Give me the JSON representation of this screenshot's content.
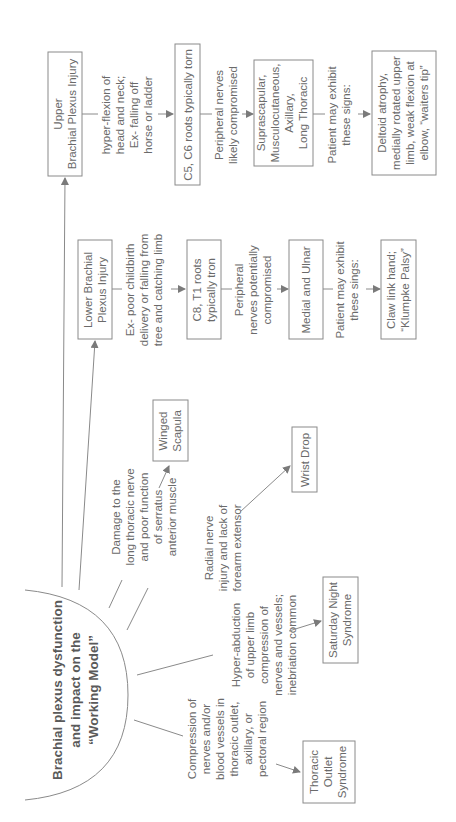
{
  "central": {
    "lines": [
      "Brachial plexus dysfunction",
      "and impact on the",
      "“Working Model”"
    ]
  },
  "upper": {
    "title": [
      "Upper",
      "Brachial Plexus Injury"
    ],
    "cause": [
      "hyper-flexion of",
      "head and neck;",
      "Ex- falling off",
      "horse or ladder"
    ],
    "roots": [
      "C5, C6 roots typically torn"
    ],
    "nerves_label": [
      "Peripheral nerves",
      "likely compromised"
    ],
    "nerves": [
      "Suprascapular,",
      "Musculocutaneous,",
      "Axillary,",
      "Long Thoracic"
    ],
    "signs_label": [
      "Patient may exhibit",
      "these signs:"
    ],
    "signs": [
      "Deltoid atrophy,",
      "medially rotated upper",
      "limb, weak flexion at",
      "elbow, “waiters tip”"
    ]
  },
  "lower": {
    "title": [
      "Lower Brachial",
      "Plexus Injury"
    ],
    "cause": [
      "Ex- poor childbirth",
      "delivery or falling from",
      "tree and catching limb"
    ],
    "roots": [
      "C8, T1 roots",
      "typically tron"
    ],
    "nerves_label": [
      "Peripheral",
      "nerves potentially",
      "compromised"
    ],
    "nerves": [
      "Medial and Ulnar"
    ],
    "signs_label": [
      "Patient may exhibit",
      "these sings:"
    ],
    "signs": [
      "Claw link hand;",
      "“Klumpke Palsy”"
    ]
  },
  "winged": {
    "cause": [
      "Damage to the",
      "long thoracic nerve",
      "and poor function",
      "of serratus",
      "anterior muscle"
    ],
    "result": [
      "Winged",
      "Scapula"
    ]
  },
  "wrist": {
    "cause": [
      "Radial nerve",
      "injury and lack of",
      "forearm extensor"
    ],
    "result": [
      "Wrist Drop"
    ]
  },
  "saturday": {
    "cause": [
      "Hyper-abduction",
      "of upper limb",
      "compression of",
      "nerves and vessels;",
      "inebriation common"
    ],
    "result": [
      "Saturday Night",
      "Syndrome"
    ]
  },
  "thoracic": {
    "cause": [
      "Compression of",
      "nerves and/or",
      "blood vessels in",
      "thoracic outlet,",
      "axillary, or",
      "pectoral region"
    ],
    "result": [
      "Thoracic",
      "Outlet",
      "Syndrome"
    ]
  }
}
